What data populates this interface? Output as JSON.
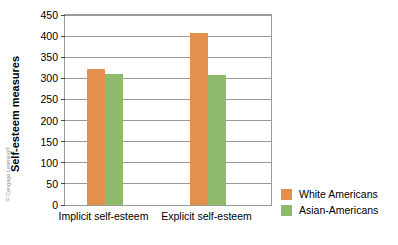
{
  "credit": "© Cengage Learning®",
  "colors": {
    "series_white_americans": "#e4904d",
    "series_asian_americans": "#8fb96b",
    "axis": "#9a9a9a",
    "text": "#000000"
  },
  "legend": {
    "position": "right",
    "items": [
      {
        "label": "White Americans",
        "color": "#e4904d"
      },
      {
        "label": "Asian-Americans",
        "color": "#8fb96b"
      }
    ]
  },
  "chart_data": {
    "type": "bar",
    "title": "",
    "xlabel": "",
    "ylabel": "Self-esteem measures",
    "categories": [
      "Implicit self-esteem",
      "Explicit self-esteem"
    ],
    "series": [
      {
        "name": "White Americans",
        "color": "#e4904d",
        "values": [
          323,
          408
        ]
      },
      {
        "name": "Asian-Americans",
        "color": "#8fb96b",
        "values": [
          310,
          307
        ]
      }
    ],
    "ylim": [
      0,
      450
    ],
    "ytick_step": 50,
    "yticks": [
      0,
      50,
      100,
      150,
      200,
      250,
      300,
      350,
      400,
      450
    ],
    "ytick_labels": [
      "0",
      "50",
      "100",
      "150",
      "200",
      "250",
      "300",
      "350",
      "400",
      "450"
    ],
    "grid": true,
    "grid_axis": "y",
    "legend_position": "right"
  }
}
